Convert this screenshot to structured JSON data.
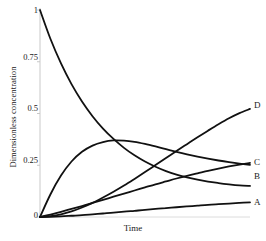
{
  "chart_data": {
    "type": "line",
    "title": "",
    "xlabel": "Time",
    "ylabel": "Dimensionless concentration",
    "xlim": [
      0,
      1
    ],
    "ylim": [
      0,
      1
    ],
    "grid": false,
    "legend_position": "right-of-curve-ends",
    "xticks": [],
    "xticklabels": [],
    "yticks": [
      0,
      0.25,
      0.5,
      0.75,
      1
    ],
    "yticklabels": [
      "0",
      "0.25",
      "0.5",
      "0.75",
      "1"
    ],
    "line_color": "#111111",
    "axis_color": "#c8c8c8",
    "series": [
      {
        "name": "A",
        "label": "A",
        "x": [
          0.0,
          0.05,
          0.1,
          0.15,
          0.2,
          0.25,
          0.3,
          0.35,
          0.4,
          0.45,
          0.5,
          0.55,
          0.6,
          0.65,
          0.7,
          0.75,
          0.8,
          0.85,
          0.9,
          0.95,
          1.0
        ],
        "values": [
          0.0,
          0.001,
          0.003,
          0.006,
          0.009,
          0.013,
          0.017,
          0.021,
          0.026,
          0.03,
          0.034,
          0.039,
          0.043,
          0.047,
          0.051,
          0.055,
          0.059,
          0.062,
          0.065,
          0.068,
          0.071
        ]
      },
      {
        "name": "B",
        "label": "B",
        "x": [
          0.0,
          0.05,
          0.1,
          0.15,
          0.2,
          0.25,
          0.3,
          0.35,
          0.4,
          0.45,
          0.5,
          0.55,
          0.6,
          0.65,
          0.7,
          0.75,
          0.8,
          0.85,
          0.9,
          0.95,
          1.0
        ],
        "values": [
          0.0,
          0.012,
          0.025,
          0.039,
          0.053,
          0.068,
          0.083,
          0.098,
          0.113,
          0.128,
          0.143,
          0.158,
          0.172,
          0.186,
          0.199,
          0.211,
          0.223,
          0.234,
          0.244,
          0.253,
          0.261
        ]
      },
      {
        "name": "C",
        "label": "C",
        "x": [
          0.0,
          0.05,
          0.1,
          0.15,
          0.2,
          0.25,
          0.3,
          0.35,
          0.4,
          0.45,
          0.5,
          0.55,
          0.6,
          0.65,
          0.7,
          0.75,
          0.8,
          0.85,
          0.9,
          0.95,
          1.0
        ],
        "values": [
          0.0,
          0.11,
          0.2,
          0.268,
          0.315,
          0.345,
          0.362,
          0.37,
          0.369,
          0.363,
          0.353,
          0.341,
          0.328,
          0.315,
          0.303,
          0.292,
          0.282,
          0.273,
          0.265,
          0.258,
          0.252
        ]
      },
      {
        "name": "D",
        "label": "D",
        "x": [
          0.0,
          0.05,
          0.1,
          0.15,
          0.2,
          0.25,
          0.3,
          0.35,
          0.4,
          0.45,
          0.5,
          0.55,
          0.6,
          0.65,
          0.7,
          0.75,
          0.8,
          0.85,
          0.9,
          0.95,
          1.0
        ],
        "values": [
          1.0,
          0.86,
          0.742,
          0.642,
          0.558,
          0.487,
          0.427,
          0.377,
          0.334,
          0.298,
          0.268,
          0.243,
          0.222,
          0.205,
          0.191,
          0.18,
          0.171,
          0.164,
          0.158,
          0.153,
          0.15
        ]
      },
      {
        "name": "D-rising",
        "label": "D",
        "x": [
          0.0,
          0.05,
          0.1,
          0.15,
          0.2,
          0.25,
          0.3,
          0.35,
          0.4,
          0.45,
          0.5,
          0.55,
          0.6,
          0.65,
          0.7,
          0.75,
          0.8,
          0.85,
          0.9,
          0.95,
          1.0
        ],
        "values": [
          0.0,
          0.004,
          0.013,
          0.027,
          0.046,
          0.068,
          0.094,
          0.122,
          0.152,
          0.184,
          0.217,
          0.251,
          0.285,
          0.319,
          0.352,
          0.385,
          0.417,
          0.448,
          0.477,
          0.502,
          0.522
        ]
      }
    ],
    "curve_labels": [
      {
        "text": "D",
        "value": 0.522
      },
      {
        "text": "C",
        "value": 0.252
      },
      {
        "text": "B",
        "value": 0.261
      },
      {
        "text": "A",
        "value": 0.071
      }
    ]
  },
  "axis": {
    "ylabel_text": "Dimensionless concentration",
    "xlabel_text": "Time",
    "tick_1": "1",
    "tick_075": "0.75",
    "tick_05": "0.5",
    "tick_025": "0.25",
    "tick_0": "0"
  },
  "labels": {
    "d": "D",
    "c": "C",
    "b": "B",
    "a": "A"
  }
}
